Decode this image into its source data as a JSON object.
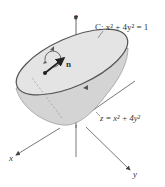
{
  "diagram": {
    "curve_label": "C: x² + 4y² = 1",
    "curve_label_prefix": "C:",
    "curve_label_eq": "x² + 4y² = 1",
    "surface_label": "z = x² + 4y²",
    "normal_label": "n",
    "axes": {
      "x": "x",
      "y": "y",
      "z": "z"
    },
    "colors": {
      "surface_fill": "#d4d4d4",
      "surface_inner": "#e2e2e2",
      "rim": "#555555",
      "axis": "#444444",
      "vector": "#222222"
    }
  }
}
